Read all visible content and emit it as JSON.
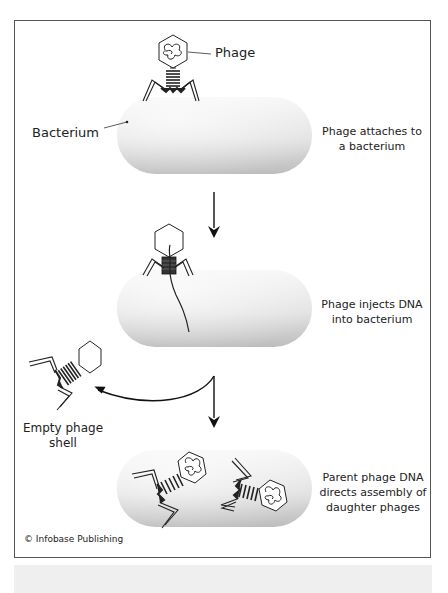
{
  "diagram": {
    "labels": {
      "phage": "Phage",
      "bacterium": "Bacterium",
      "empty_shell_line1": "Empty phage",
      "empty_shell_line2": "shell"
    },
    "steps": [
      {
        "line1": "Phage attaches to",
        "line2": "a bacterium"
      },
      {
        "line1": "Phage injects DNA",
        "line2": "into bacterium"
      },
      {
        "line1": "Parent phage DNA",
        "line2": "directs assembly of",
        "line3": "daughter phages"
      }
    ],
    "credit": "© Infobase Publishing",
    "colors": {
      "border": "#555555",
      "ink": "#222222",
      "bacterium_light": "#f4f4f4",
      "bacterium_dark": "#c6c6c6",
      "band": "#efefef"
    }
  }
}
